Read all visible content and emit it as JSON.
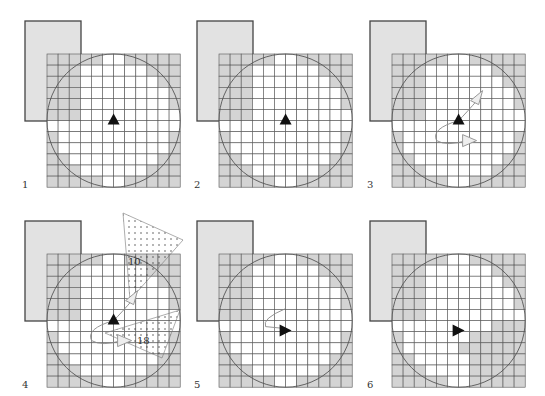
{
  "figure": {
    "panels": [
      {
        "label": "1",
        "ox": 0,
        "oy": 0,
        "arrow": "up",
        "path": null,
        "shaded": []
      },
      {
        "label": "2",
        "ox": 172,
        "oy": 0,
        "arrow": "up",
        "path": null,
        "shaded": "corners"
      },
      {
        "label": "3",
        "ox": 345,
        "oy": 0,
        "arrow": "up",
        "path": "wander",
        "shaded": "corners"
      },
      {
        "label": "4",
        "ox": 0,
        "oy": 200,
        "arrow": "up",
        "path": "wander",
        "shaded": "corners",
        "cones": [
          {
            "label": "10"
          },
          {
            "label": "18"
          }
        ]
      },
      {
        "label": "5",
        "ox": 172,
        "oy": 200,
        "arrow": "right",
        "path": "hook",
        "shaded": "corners"
      },
      {
        "label": "6",
        "ox": 345,
        "oy": 200,
        "arrow": "right",
        "path": null,
        "shaded": "corners-plus-lowerright"
      }
    ],
    "grid": {
      "cols": 12,
      "rows": 12,
      "cell": 11.1
    },
    "colors": {
      "shade": "#d4d4d4",
      "rect": "#e2e2e2",
      "line": "#555555",
      "arrow": "#111111",
      "ghost": "#cccccc"
    }
  }
}
